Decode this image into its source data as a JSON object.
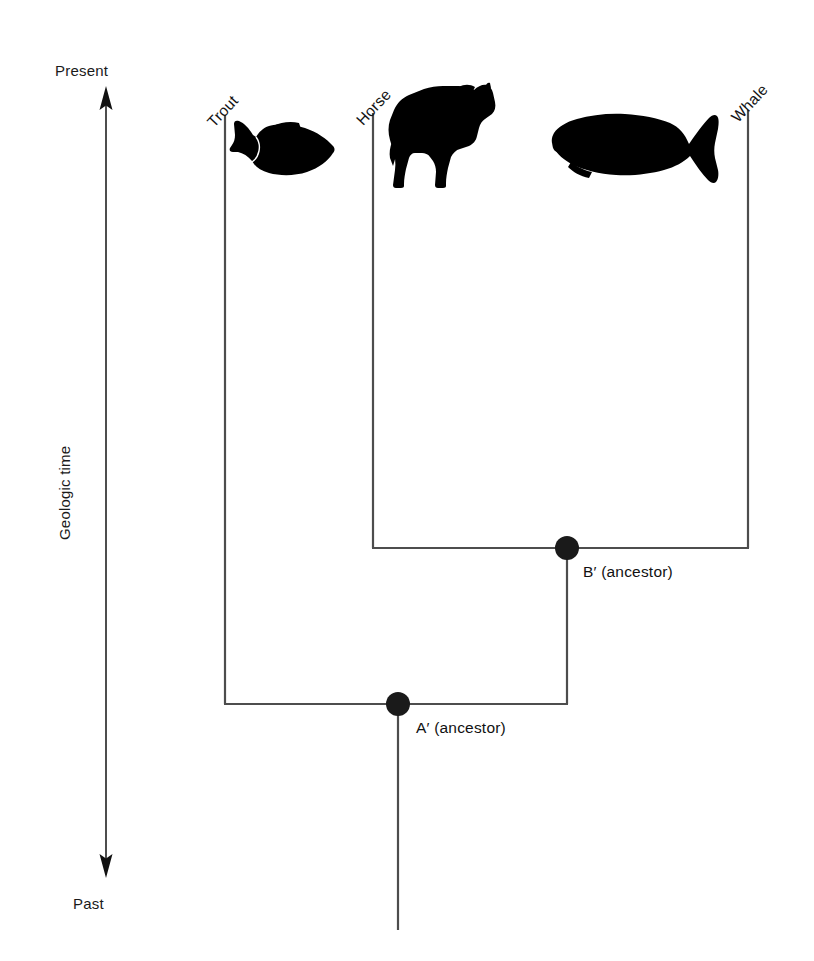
{
  "figure": {
    "kind": "phylogenetic-tree",
    "background_color": "#ffffff",
    "line_color": "#4d4d4d",
    "node_color": "#1a1a1a",
    "silhouette_color": "#000000",
    "width": 814,
    "height": 961
  },
  "axis": {
    "top_label": "Present",
    "bottom_label": "Past",
    "vertical_label": "Geologic time",
    "arrow_style": "double-headed",
    "arrow_x": 106,
    "arrow_top_y": 92,
    "arrow_bottom_y": 872
  },
  "taxa": [
    {
      "id": "trout",
      "label": "Trout",
      "icon": "trout-silhouette-icon",
      "branch_x": 225,
      "tip_y": 115
    },
    {
      "id": "horse",
      "label": "Horse",
      "icon": "horse-silhouette-icon",
      "branch_x": 373,
      "tip_y": 113
    },
    {
      "id": "whale",
      "label": "Whale",
      "icon": "whale-silhouette-icon",
      "branch_x": 748,
      "tip_y": 110
    }
  ],
  "nodes": [
    {
      "id": "node-b",
      "label": "B′ (ancestor)",
      "x": 567,
      "y": 548,
      "children": [
        "horse",
        "whale"
      ],
      "bar_left_x": 373,
      "bar_right_x": 748
    },
    {
      "id": "node-a",
      "label": "A′ (ancestor)",
      "x": 398,
      "y": 704,
      "children": [
        "trout",
        "node-b"
      ],
      "bar_left_x": 225,
      "bar_right_x": 567
    }
  ],
  "root": {
    "x": 398,
    "top_y": 704,
    "bottom_y": 930
  }
}
